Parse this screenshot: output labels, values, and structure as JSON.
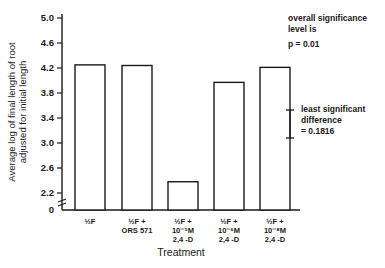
{
  "chart_data": {
    "type": "bar",
    "title": "",
    "xlabel": "Treatment",
    "ylabel_lines": [
      "Average log of final length of root",
      "adjusted for initial length"
    ],
    "categories": [
      [
        "½F"
      ],
      [
        "½F +",
        "ORS 571"
      ],
      [
        "½F +",
        "10⁻⁵M",
        "2,4 -D"
      ],
      [
        "½F +",
        "10⁻⁶M",
        "2,4 -D"
      ],
      [
        "½F +",
        "10⁻⁸M",
        "2,4 -D"
      ]
    ],
    "values": [
      4.25,
      4.24,
      2.38,
      3.97,
      4.21
    ],
    "yticks": [
      5.0,
      4.6,
      4.2,
      3.8,
      3.4,
      3.0,
      2.6,
      2.2
    ],
    "ytick_labels": [
      "5.0",
      "4.6",
      "4.2",
      "3.8",
      "3.4",
      "3.0",
      "2.6",
      "2.2"
    ],
    "baseline_label": "0",
    "axis_break": true,
    "ylim": [
      2.2,
      5.0
    ],
    "grid": false,
    "legend": "none",
    "bar_fill": "#ffffff",
    "bar_stroke": "#1a1a1a"
  },
  "annotations": {
    "significance_line1": "overall significance",
    "significance_line2": "level is",
    "significance_p": "p = 0.01",
    "lsd_line1": "least significant",
    "lsd_line2": "difference",
    "lsd_value": "= 0.1816"
  }
}
